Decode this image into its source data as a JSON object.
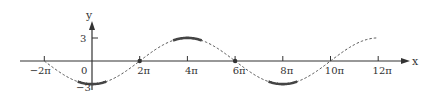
{
  "chart_data": {
    "type": "line",
    "title": "",
    "xlabel": "x",
    "ylabel": "y",
    "function": "y = -3 cos(x/4)",
    "x_ticks": [
      "−2π",
      "0",
      "2π",
      "4π",
      "6π",
      "8π",
      "10π",
      "12π"
    ],
    "x_tick_values_pi": [
      -2,
      0,
      2,
      4,
      6,
      8,
      10,
      12
    ],
    "y_ticks": [
      "3",
      "−3"
    ],
    "y_tick_values": [
      3,
      -3
    ],
    "xlim_pi": [
      -2,
      12
    ],
    "ylim": [
      -3,
      3
    ],
    "grid": false,
    "series": [
      {
        "name": "curve (dashed)",
        "style": "dashed",
        "x_pi": [
          -2,
          0,
          2,
          4,
          6,
          8,
          10,
          12
        ],
        "values": [
          0,
          -3,
          0,
          3,
          0,
          -3,
          0,
          3
        ]
      }
    ],
    "highlights": [
      {
        "type": "solid-segment",
        "near_x_pi": 0,
        "y": -3
      },
      {
        "type": "point",
        "x_pi": 2,
        "y": 0
      },
      {
        "type": "solid-segment",
        "near_x_pi": 4,
        "y": 3
      },
      {
        "type": "point",
        "x_pi": 6,
        "y": 0
      },
      {
        "type": "solid-segment",
        "near_x_pi": 8,
        "y": -3
      }
    ]
  },
  "labels": {
    "x_axis": "x",
    "y_axis": "y",
    "origin": "0",
    "y_top": "3",
    "y_bottom": "−3",
    "ticks": [
      "−2π",
      "2π",
      "4π",
      "6π",
      "8π",
      "10π",
      "12π"
    ]
  }
}
